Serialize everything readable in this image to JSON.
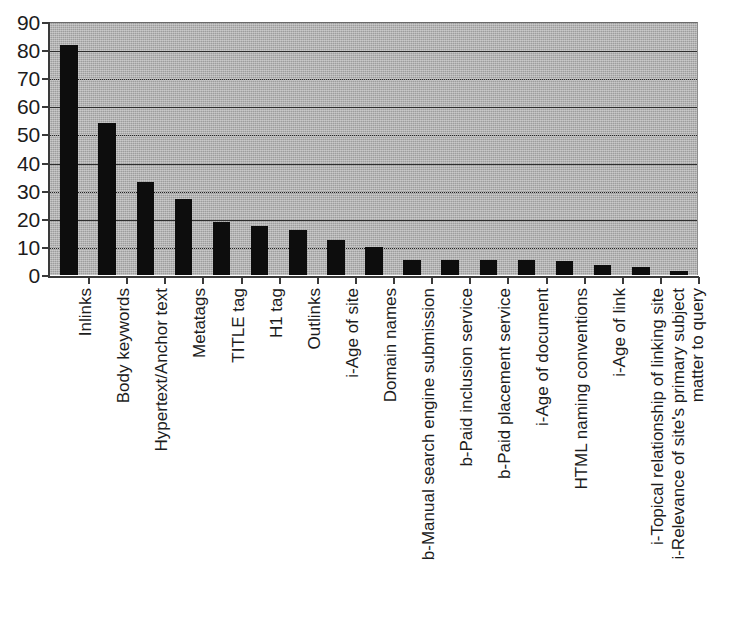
{
  "chart_data": {
    "type": "bar",
    "title": "",
    "subtitle": "",
    "xlabel": "",
    "ylabel": "",
    "ylim": [
      0,
      90
    ],
    "ytick_step": 10,
    "yticks": [
      90,
      80,
      70,
      60,
      50,
      40,
      30,
      20,
      10,
      0
    ],
    "grid": true,
    "grid_axis": "y",
    "legend": false,
    "legend_position": "none",
    "orientation": "vertical",
    "bar_color": "#0d0d0d",
    "plot_background": "#9d9d9d",
    "page_background": "#ffffff",
    "categories": [
      "Inlinks",
      "Body keywords",
      "Hypertext/Anchor text",
      "Metatags",
      "TITLE tag",
      "H1 tag",
      "Outlinks",
      "i-Age of site",
      "Domain names",
      "b-Manual search engine submission",
      "b-Paid inclusion service",
      "b-Paid placement service",
      "i-Age of document",
      "HTML naming conventions",
      "i-Age of link",
      "i-Topical relationship of linking site",
      "i-Relevance of site's primary subject matter to query"
    ],
    "category_lines": [
      [
        "Inlinks"
      ],
      [
        "Body keywords"
      ],
      [
        "Hypertext/Anchor text"
      ],
      [
        "Metatags"
      ],
      [
        "TITLE tag"
      ],
      [
        "H1 tag"
      ],
      [
        "Outlinks"
      ],
      [
        "i-Age of site"
      ],
      [
        "Domain names"
      ],
      [
        "b-Manual search engine submission"
      ],
      [
        "b-Paid inclusion service"
      ],
      [
        "b-Paid placement service"
      ],
      [
        "i-Age of document"
      ],
      [
        "HTML naming conventions"
      ],
      [
        "i-Age of link"
      ],
      [
        "i-Topical relationship of linking site"
      ],
      [
        "i-Relevance of site's primary subject",
        "matter to query"
      ]
    ],
    "values": [
      82,
      54,
      33,
      27,
      19,
      17.5,
      16,
      12.5,
      10,
      5.5,
      5.5,
      5.5,
      5.5,
      5,
      3.5,
      3,
      1.5
    ]
  }
}
